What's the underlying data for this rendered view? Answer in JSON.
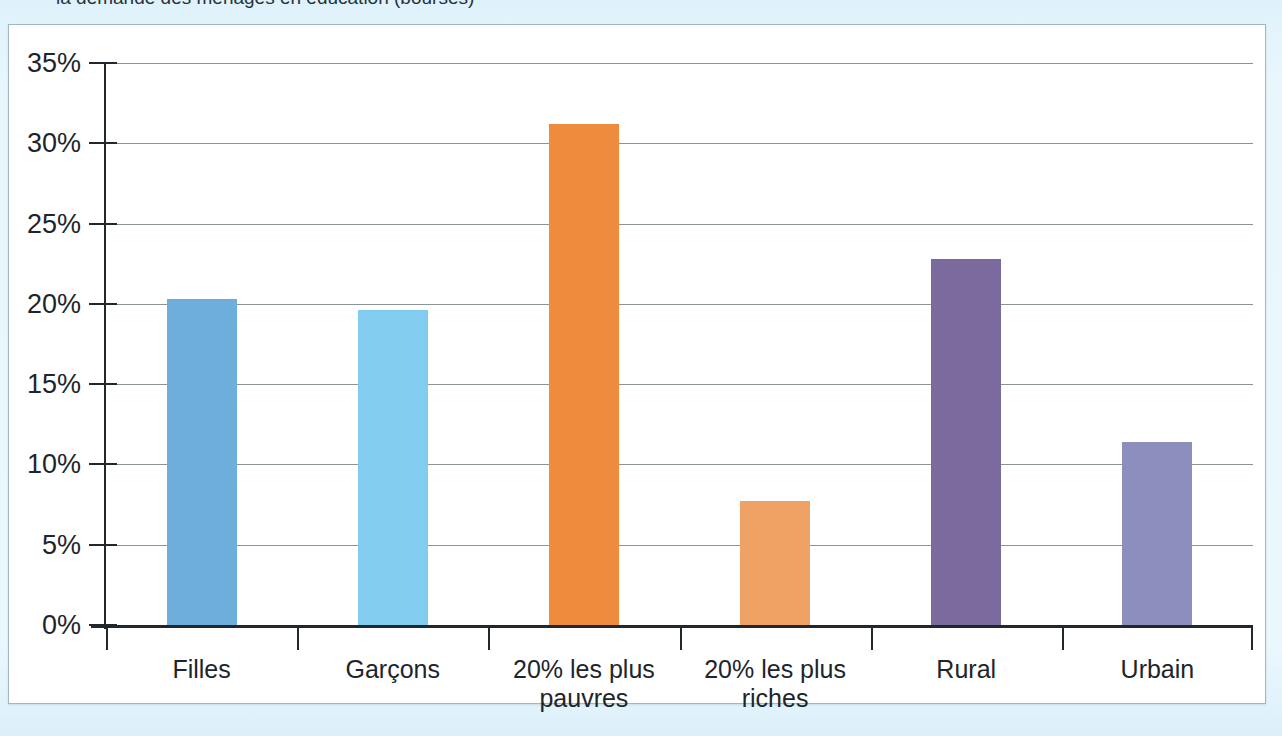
{
  "caption": {
    "text": "la demande des ménages en éducation (bourses)"
  },
  "chart_data": {
    "type": "bar",
    "title": "",
    "subtitle": "",
    "xlabel": "",
    "ylabel": "",
    "ylim": [
      0,
      35
    ],
    "ytick_labels": [
      "0%",
      "5%",
      "10%",
      "15%",
      "20%",
      "25%",
      "30%",
      "35%"
    ],
    "ytick_values": [
      0,
      5,
      10,
      15,
      20,
      25,
      30,
      35
    ],
    "grid": true,
    "legend": "none",
    "units": "percent",
    "categories": [
      "Filles",
      "Garçons",
      "20% les plus pauvres",
      "20% les plus riches",
      "Rural",
      "Urbain"
    ],
    "values": [
      20.3,
      19.6,
      31.2,
      7.7,
      22.8,
      11.4
    ],
    "value_labels": [
      "20,3%",
      "19,6%",
      "31,2%",
      "7,7%",
      "22,8%",
      "11,4%"
    ],
    "bar_colors": [
      "#6DAEDC",
      "#81CCEF",
      "#EE8B3C",
      "#EFA263",
      "#7A6A9D",
      "#8C8EBE"
    ],
    "bars": [
      {
        "category": "Filles",
        "label_lines": [
          "Filles"
        ],
        "value": 20.3,
        "color": "#6DAEDC"
      },
      {
        "category": "Garçons",
        "label_lines": [
          "Garçons"
        ],
        "value": 19.6,
        "color": "#81CCEF"
      },
      {
        "category": "20% les plus pauvres",
        "label_lines": [
          "20% les plus",
          "pauvres"
        ],
        "value": 31.2,
        "color": "#EE8B3C"
      },
      {
        "category": "20% les plus riches",
        "label_lines": [
          "20% les plus",
          "riches"
        ],
        "value": 7.7,
        "color": "#EFA263"
      },
      {
        "category": "Rural",
        "label_lines": [
          "Rural"
        ],
        "value": 22.8,
        "color": "#7A6A9D"
      },
      {
        "category": "Urbain",
        "label_lines": [
          "Urbain"
        ],
        "value": 11.4,
        "color": "#8C8EBE"
      }
    ]
  },
  "colors": {
    "page_background": "#E4F4FC",
    "panel_background": "#FFFFFF",
    "panel_border": "#9FB8C4",
    "axis": "#20282E",
    "gridline": "#8D9498",
    "text": "#1D252B"
  }
}
